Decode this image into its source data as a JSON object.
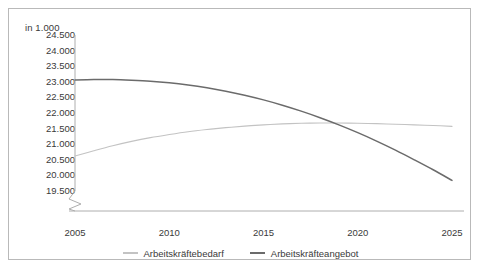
{
  "chart_data": {
    "type": "line",
    "title": "",
    "subtitle": "",
    "ylabel": "in 1.000",
    "xlabel": "",
    "ylim": [
      19250,
      24750
    ],
    "xlim": [
      2005,
      2025
    ],
    "yticks": [
      "24.500",
      "24.000",
      "23.500",
      "23.000",
      "22.500",
      "22.000",
      "21.500",
      "21.000",
      "20.500",
      "20.000",
      "19.500"
    ],
    "ytick_values": [
      24500,
      24000,
      23500,
      23000,
      22500,
      22000,
      21500,
      21000,
      20500,
      20000,
      19500
    ],
    "xticks": [
      "2005",
      "2010",
      "2015",
      "2020",
      "2025"
    ],
    "xtick_values": [
      2005,
      2010,
      2015,
      2020,
      2025
    ],
    "axis_break": true,
    "grid": false,
    "legend_position": "bottom",
    "x": [
      2005,
      2006,
      2007,
      2008,
      2009,
      2010,
      2011,
      2012,
      2013,
      2014,
      2015,
      2016,
      2017,
      2018,
      2019,
      2020,
      2021,
      2022,
      2023,
      2024,
      2025
    ],
    "series": [
      {
        "name": "Arbeitskräftebedarf",
        "color": "#c3c3c3",
        "values": [
          20620,
          20790,
          20950,
          21090,
          21210,
          21310,
          21400,
          21470,
          21530,
          21580,
          21620,
          21650,
          21670,
          21680,
          21680,
          21670,
          21660,
          21640,
          21620,
          21600,
          21570
        ]
      },
      {
        "name": "Arbeitskräfteangebot",
        "color": "#6b6b6b",
        "values": [
          23060,
          23070,
          23070,
          23050,
          23020,
          22970,
          22900,
          22810,
          22700,
          22570,
          22420,
          22250,
          22060,
          21850,
          21620,
          21370,
          21100,
          20810,
          20500,
          20180,
          19840
        ]
      }
    ]
  },
  "legend": {
    "items": [
      {
        "label": "Arbeitskräftebedarf",
        "color": "#c3c3c3"
      },
      {
        "label": "Arbeitskräfteangebot",
        "color": "#6b6b6b"
      }
    ]
  },
  "colors": {
    "frame_border": "#b9b9b9",
    "axis_line": "#aeaeae",
    "text": "#3a3a3a",
    "background": "#ffffff"
  },
  "bottom_strip": {
    "text": ""
  }
}
